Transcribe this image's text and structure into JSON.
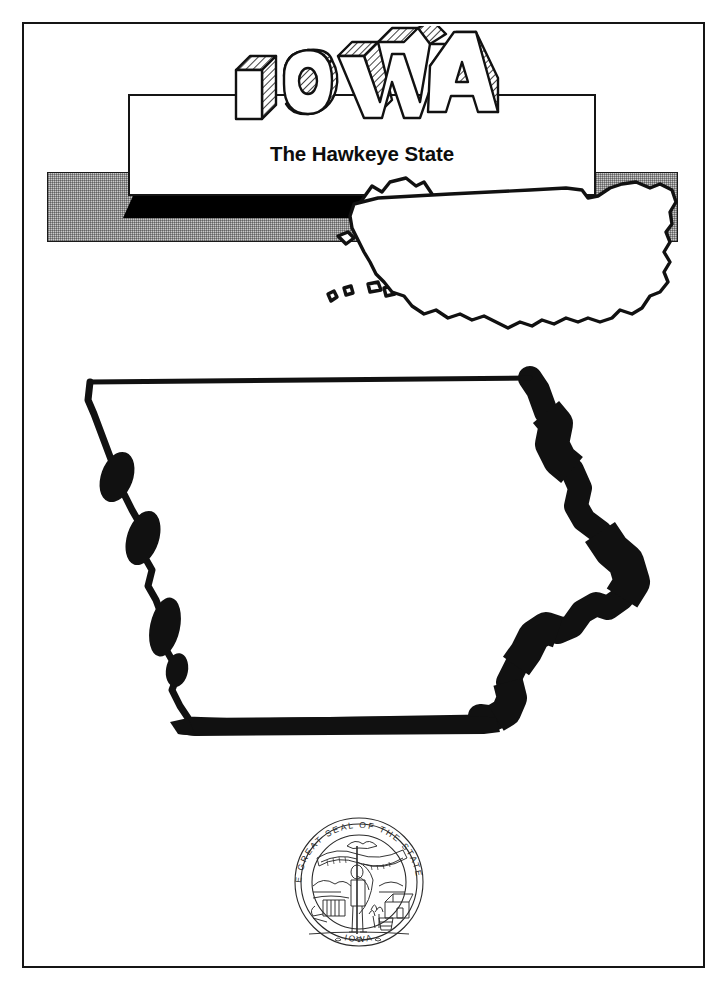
{
  "page": {
    "state_name": "IOWA",
    "tagline": "The Hawkeye State",
    "background_color": "#ffffff",
    "ink_color": "#111111",
    "band_color": "#c9c9c9",
    "border_color": "#151515"
  },
  "wordmark": {
    "text": "IOWA",
    "letters": [
      "I",
      "O",
      "W",
      "A"
    ],
    "style": "3d-block-hatched"
  },
  "locator_map": {
    "name": "united-states-outline",
    "insets": [
      "Alaska",
      "Hawaii"
    ],
    "band_label": ""
  },
  "state_outline": {
    "name": "iowa-state-outline",
    "west_border": "Missouri River",
    "east_border": "Mississippi River"
  },
  "seal": {
    "legend": "THE GREAT SEAL OF THE STATE OF IOWA",
    "legend_top": "GREAT SEAL OF THE STATE OF",
    "legend_prefix": "THE",
    "legend_suffix": "IOWA",
    "motto": "OUR LIBERTIES WE PRIZE AND OUR RIGHTS WE WILL MAINTAIN",
    "elements": [
      "soldier",
      "flag",
      "banner",
      "eagle",
      "plow",
      "wheat",
      "river",
      "cabin"
    ]
  }
}
